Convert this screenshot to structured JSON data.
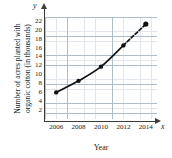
{
  "chart_data": {
    "type": "line",
    "title": "",
    "xlabel": "Year",
    "ylabel_line1": "Number of acres planted with",
    "ylabel_line2": "organic cotton (in thousands)",
    "axis_var_x": "x",
    "axis_var_y": "y",
    "x": [
      2006,
      2008,
      2010,
      2012,
      2014
    ],
    "values": [
      6,
      8.6,
      11.8,
      16.6,
      21.4
    ],
    "xticks": [
      "2006",
      "2008",
      "2010",
      "2012",
      "2014"
    ],
    "yticks": [
      "2",
      "4",
      "6",
      "8",
      "10",
      "12",
      "14",
      "16",
      "18",
      "20",
      "22"
    ],
    "xlim": [
      2005,
      2015
    ],
    "ylim": [
      0,
      23
    ],
    "grid": true,
    "legend": "none",
    "dashed_segment": "2012-2014",
    "marker": "filled-circle",
    "colors": {
      "line": "#111111",
      "marker": "#111111",
      "axis": "#3b3b3b",
      "grid": "#c9d4de",
      "background": "#ffffff"
    }
  }
}
